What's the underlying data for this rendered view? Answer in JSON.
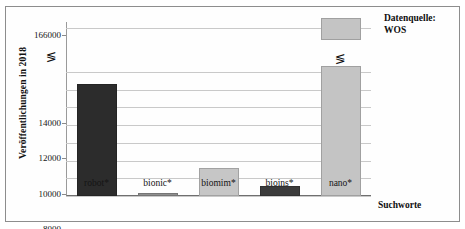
{
  "chart_data": {
    "type": "bar",
    "title": "",
    "xlabel": "Suchworte",
    "ylabel": "Veröffentlichungen in 2018",
    "categories": [
      "robot*",
      "bionic*",
      "biomim*",
      "bioins*",
      "nano*"
    ],
    "values": [
      12700,
      300,
      3200,
      1100,
      166000
    ],
    "series": [
      {
        "name": "Veröffentlichungen in 2018",
        "values": [
          12700,
          300,
          3200,
          1100,
          166000
        ]
      }
    ],
    "bar_colors": [
      "#2c2c2c",
      "#8f8f8f",
      "#c6c6c6",
      "#3b3b3b",
      "#c4c4c4"
    ],
    "ylim": [
      0,
      166000
    ],
    "axis_break": true,
    "axis_break_symbol": "≶",
    "axis_break_note": "Y-Achse unterbrochen zwischen 14000 und 166000",
    "ytick_labels": [
      "0",
      "2000",
      "4000",
      "6000",
      "8000",
      "10000",
      "12000",
      "14000",
      "166000"
    ],
    "ytick_values": [
      0,
      2000,
      4000,
      6000,
      8000,
      10000,
      12000,
      14000,
      166000
    ],
    "grid": true,
    "legend": "none",
    "annotations": [
      "Datenquelle:",
      "WOS"
    ]
  },
  "axes": {
    "y_title": "Veröffentlichungen in 2018",
    "x_title": "Suchworte"
  },
  "annotation": {
    "line1": "Datenquelle:",
    "line2": "WOS"
  },
  "glyphs": {
    "break_symbol": "≶"
  }
}
